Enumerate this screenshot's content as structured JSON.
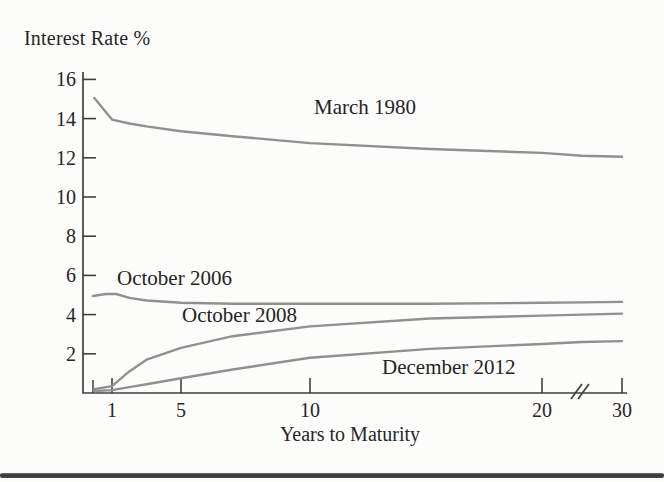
{
  "chart_data": {
    "type": "line",
    "title": "Interest Rate %",
    "xlabel": "Years to Maturity",
    "ylabel": "Interest Rate %",
    "x_ticks": [
      1,
      5,
      10,
      20,
      30
    ],
    "minor_x_ticks": [
      0.25
    ],
    "y_ticks": [
      16,
      14,
      12,
      10,
      8,
      6,
      4,
      2
    ],
    "ylim": [
      0,
      16
    ],
    "xlim": [
      0.25,
      30
    ],
    "axis_break": {
      "axis": "x",
      "between": [
        20,
        30
      ],
      "symbol": "//"
    },
    "grid": false,
    "legend": "inline-labels",
    "line_color": "#909090",
    "axis_color": "#3f3f3f",
    "series": [
      {
        "name": "March 1980",
        "x": [
          0.3,
          1,
          2,
          3,
          5,
          7,
          10,
          15,
          20,
          25,
          30
        ],
        "y": [
          15.05,
          13.95,
          13.75,
          13.6,
          13.35,
          13.1,
          12.75,
          12.45,
          12.25,
          12.1,
          12.05
        ]
      },
      {
        "name": "October 2006",
        "x": [
          0.25,
          0.75,
          1.25,
          2,
          3,
          5,
          7,
          10,
          15,
          20,
          25,
          30
        ],
        "y": [
          4.95,
          5.05,
          5.05,
          4.85,
          4.72,
          4.6,
          4.55,
          4.55,
          4.55,
          4.6,
          4.62,
          4.65
        ]
      },
      {
        "name": "October 2008",
        "x": [
          0.3,
          1,
          2,
          3,
          5,
          7,
          10,
          15,
          20,
          25,
          30
        ],
        "y": [
          0.2,
          0.35,
          1.1,
          1.7,
          2.3,
          2.9,
          3.4,
          3.8,
          3.95,
          4.0,
          4.05
        ]
      },
      {
        "name": "December 2012",
        "x": [
          0.3,
          1,
          2,
          3,
          5,
          7,
          10,
          15,
          20,
          25,
          30
        ],
        "y": [
          0.1,
          0.15,
          0.3,
          0.45,
          0.75,
          1.2,
          1.8,
          2.25,
          2.5,
          2.6,
          2.65
        ]
      }
    ]
  }
}
